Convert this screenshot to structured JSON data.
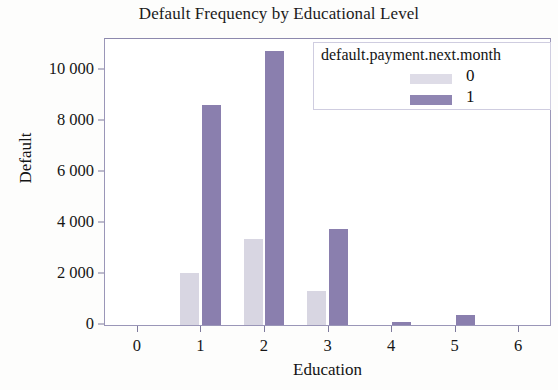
{
  "chart_data": {
    "type": "bar",
    "title": "Default Frequency by Educational Level",
    "xlabel": "Education",
    "ylabel": "Default",
    "categories": [
      "0",
      "1",
      "2",
      "3",
      "4",
      "5",
      "6"
    ],
    "series": [
      {
        "name": "0",
        "color": "#d8d6e2",
        "values": [
          0,
          2050,
          3350,
          1320,
          0,
          0,
          0
        ]
      },
      {
        "name": "1",
        "color": "#8a7fae",
        "values": [
          0,
          8600,
          10750,
          3750,
          120,
          400,
          0
        ]
      }
    ],
    "ylim": [
      0,
      11200
    ],
    "xlim": [
      -0.5,
      6.5
    ],
    "yticks": [
      0,
      2000,
      4000,
      6000,
      8000,
      10000
    ],
    "ytick_labels": [
      "0",
      "2 000",
      "4 000",
      "6 000",
      "8 000",
      "10 000"
    ],
    "xtick_labels": [
      "0",
      "1",
      "2",
      "3",
      "4",
      "5",
      "6"
    ],
    "grid": false,
    "legend": {
      "title": "default.payment.next.month",
      "position": "top-right",
      "entries": [
        {
          "label": "0",
          "color": "#dedce7"
        },
        {
          "label": "1",
          "color": "#8f85b2"
        }
      ]
    },
    "frame_color": "#9a96b8",
    "background": "#ffffff"
  }
}
